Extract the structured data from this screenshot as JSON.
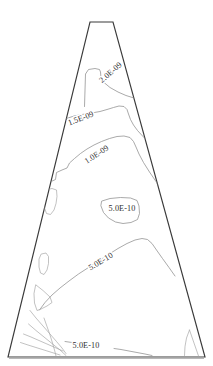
{
  "figure": {
    "name": "contour-plot",
    "background_color": "#ffffff",
    "domain_outline_color": "#3a3a3a",
    "contour_color": "#8d8d8d",
    "label_color": "#2e2e2e"
  },
  "chart_data": {
    "type": "contour",
    "title": "",
    "subtitle": "",
    "xlabel": "",
    "ylabel": "",
    "grid": false,
    "legend": "none",
    "axes_visible": false,
    "tick_labels": [],
    "domain_shape": "trapezoid",
    "domain_vertices": [
      [
        90,
        22
      ],
      [
        113,
        22
      ],
      [
        205,
        357
      ],
      [
        8,
        357
      ]
    ],
    "levels": [
      {
        "value": 2e-09,
        "label": "2.0E-09"
      },
      {
        "value": 1.5e-09,
        "label": "1.5E-09"
      },
      {
        "value": 1e-09,
        "label": "1.0E-09"
      },
      {
        "value": 5e-10,
        "label": "5.0E-10"
      }
    ],
    "annotations": [
      {
        "id": "label-2p0em9",
        "text": "2.0E-09",
        "x": 111,
        "y": 73,
        "rotation": -41,
        "level": 2e-09
      },
      {
        "id": "label-1p5em9",
        "text": "1.5E-09",
        "x": 81,
        "y": 119,
        "rotation": -21,
        "level": 1.5e-09
      },
      {
        "id": "label-1p0em9",
        "text": "1.0E-09",
        "x": 97,
        "y": 155,
        "rotation": -33,
        "level": 1e-09
      },
      {
        "id": "label-5p0em10-mid",
        "text": "5.0E-10",
        "x": 122,
        "y": 209,
        "rotation": 0,
        "level": 5e-10
      },
      {
        "id": "label-5p0em10-diag",
        "text": "5.0E-10",
        "x": 101,
        "y": 262,
        "rotation": -31,
        "level": 5e-10
      },
      {
        "id": "label-5p0em10-bottom",
        "text": "5.0E-10",
        "x": 86,
        "y": 346,
        "rotation": 0,
        "level": 5e-10
      }
    ],
    "contour_paths": {
      "level_2p0em9": "M 84.5 106.5 L 85.5 74.0 L 88.5 69.5 L 95.0 68.5 L 99.5 69.5 L 100.5 72.0 L 101.0 78.0 L 104.0 82.5 L 110.0 87.5 L 118.0 92.0 L 126.0 95.5 L 134.0 98.0 L 140.0 99.0 L 146.5 99.0",
      "level_1p5em9": "M 60.0 122.5 L 66.5 118.5 L 74.0 116.0 L 82.0 114.5 L 91.5 113.0 L 100.0 111.5 L 107.0 109.5 L 113.5 107.5 L 119.0 106.0 L 124.0 106.5 L 127.0 109.5 L 128.5 114.0 L 130.5 119.5 L 133.5 125.0 L 137.5 130.5 L 143.0 136.5 L 149.0 142.5",
      "level_1p0em9": "M 45.0 183.5 L 50.0 182.0 L 55.5 179.5 L 56.5 172.5 L 62.0 170.0 L 67.0 168.0 L 69.5 163.0 L 74.5 158.5 L 80.5 153.5 L 87.0 149.0 L 94.0 145.0 L 101.5 141.5 L 109.5 138.5 L 117.0 136.5 L 124.0 136.0 L 130.0 137.5 L 133.5 141.5 L 136.0 147.0 L 139.0 154.0 L 143.5 162.5 L 149.5 172.0 L 156.0 181.5 L 162.0 190.5",
      "level_5p0em10_blob": "M 102.0 201.0 L 110.0 198.5 L 120.5 197.5 L 130.5 198.0 L 137.0 200.5 L 139.0 206.0 L 139.5 213.5 L 137.5 219.5 L 131.0 222.5 L 123.0 223.5 L 115.5 222.0 L 108.5 218.0 L 103.5 212.5 L 101.0 206.0 Z",
      "level_5p0em10_diag": "M 39.5 310.0 L 45.0 302.5 L 52.0 295.0 L 60.0 288.0 L 69.0 281.0 L 78.5 274.0 L 88.5 267.5 L 98.5 261.0 L 108.5 254.5 L 118.0 248.5 L 127.0 243.5 L 135.0 240.0 L 142.0 238.5 L 147.5 239.5 L 152.0 243.5 L 156.5 250.0 L 162.5 258.5 L 169.0 267.5 L 175.0 276.0",
      "level_5p0em10_bottom": "M 65.0 341.5 L 72.0 342.5 L 79.0 344.0 L 85.0 345.5 M 114.0 348.5 L 121.0 349.5 L 129.0 351.0 L 137.0 352.5 L 145.0 354.0 L 152.0 355.5",
      "small_closed_left_upper": "M 45.0 190.0 L 52.0 188.5 L 56.5 190.0 L 57.0 196.5 L 56.0 203.5 L 54.0 210.0 L 50.5 214.5 L 46.5 213.5 L 44.5 208.0 L 44.0 200.0 Z",
      "small_closed_left_oval": "M 41.5 254.0 L 46.0 253.0 L 48.5 256.5 L 48.5 263.5 L 47.0 270.0 L 44.0 274.5 L 40.5 273.0 L 39.0 267.0 L 39.0 259.5 Z",
      "small_closed_left_tri": "M 36.0 285.0 L 43.0 290.5 L 50.0 297.0 L 52.0 302.5 L 47.0 306.0 L 41.0 309.0 L 37.0 310.5 L 34.5 303.0 L 34.0 294.0 Z",
      "bottom_left_fan_a": "M 30.0 310.5 L 36.0 318.0 L 43.0 326.0 L 50.0 334.0 L 56.5 341.5 L 62.0 348.0 L 66.0 353.5",
      "bottom_left_fan_b": "M 44.0 318.0 L 47.0 326.5 L 50.0 335.0 L 52.5 343.0 L 54.5 350.0 L 56.0 356.0",
      "bottom_left_fan_c": "M 28.5 324.0 L 36.0 330.5 L 44.0 337.0 L 52.0 343.5 L 60.0 350.0 L 66.0 355.5",
      "bottom_left_fan_d": "M 20.5 342.5 L 28.0 345.0 L 36.0 347.5 L 44.0 350.0 L 52.0 352.5 L 60.0 355.0",
      "bottom_left_fan_e": "M 23.5 334.0 L 31.0 337.0 L 39.0 340.5 L 47.0 344.0 L 55.0 347.5 L 63.0 351.0",
      "bottom_right_sliver": "M 189.5 330.0 L 186.5 338.0 L 185.0 346.5 L 184.5 355.5 M 189.5 330.0 L 194.0 343.0 L 198.5 356.0"
    }
  },
  "labels": {
    "l0": "2.0E-09",
    "l1": "1.5E-09",
    "l2": "1.0E-09",
    "l3": "5.0E-10",
    "l4": "5.0E-10",
    "l5": "5.0E-10"
  }
}
